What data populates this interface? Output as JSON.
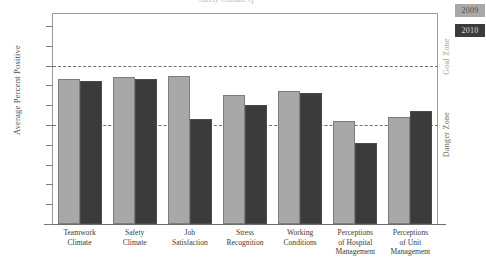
{
  "chart_data": {
    "type": "bar",
    "title": "",
    "xlabel": "",
    "ylabel": "Average Percent Positive",
    "ylim": [
      0,
      100
    ],
    "grid": false,
    "legend_position": "top-right",
    "categories": [
      "Teamwork Climate",
      "Safety Climate",
      "Job Satisfaction",
      "Stress Recognition",
      "Working Conditions",
      "Perceptions of Hospital Management",
      "Perceptions of Unit Management"
    ],
    "category_lines": [
      [
        "Teamwork",
        "Climate"
      ],
      [
        "Safety",
        "Climate"
      ],
      [
        "Job",
        "Satisfaction"
      ],
      [
        "Stress",
        "Recognition"
      ],
      [
        "Working",
        "Conditions"
      ],
      [
        "Perceptions",
        "of Hospital",
        "Management"
      ],
      [
        "Perceptions",
        "of Unit",
        "Management"
      ]
    ],
    "series": [
      {
        "name": "2009",
        "color": "#a8a8a8",
        "values": [
          73,
          74,
          75,
          65,
          67,
          52,
          54
        ]
      },
      {
        "name": "2010",
        "color": "#3b3b3b",
        "values": [
          72,
          73,
          53,
          60,
          66,
          41,
          57
        ]
      }
    ],
    "y_tick_labels": [
      "100",
      "90",
      "80",
      "70",
      "50",
      "60",
      "40",
      "30",
      "20",
      "10",
      "0"
    ],
    "y_tick_values": [
      100,
      90,
      80,
      70,
      60,
      50,
      40,
      30,
      20,
      10,
      0
    ],
    "reference_lines": [
      {
        "label": "Goal Zone",
        "value": 80
      },
      {
        "label": "Danger Zone",
        "value": 50
      }
    ],
    "annotations": [
      {
        "name": "goal-zone",
        "text": "Goal Zone"
      },
      {
        "name": "danger-zone",
        "text": "Danger Zone"
      }
    ]
  },
  "legend": {
    "items": [
      {
        "label": "2009"
      },
      {
        "label": "2010"
      }
    ]
  },
  "title_fragment": {
    "text": "Safety Climate Q"
  }
}
